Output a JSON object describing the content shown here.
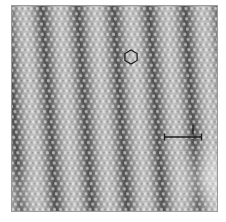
{
  "figure": {
    "type": "STM micrograph",
    "colormap": "grayscale",
    "colors": {
      "background": "#ffffff",
      "base_gray": "#a8a8a8",
      "dark_stripe": "#3a3a3a",
      "bright_atom": "#e6e6e6",
      "annotation": "#1a1a1a"
    },
    "panel": {
      "x": 11,
      "y": 5,
      "width": 207,
      "height": 207
    },
    "stripes": {
      "orientation": "near-vertical, tilted slightly clockwise",
      "period_px": 36,
      "dark_x_at_top": [
        30,
        67,
        102,
        138,
        175,
        207
      ],
      "dark_x_at_bottom": [
        42,
        72,
        108,
        145,
        183
      ]
    },
    "lattice": {
      "pattern": "hexagonal",
      "spacing_px": 6
    },
    "annotations": {
      "hexagon_marker": {
        "cx": 131,
        "cy": 57,
        "r": 7,
        "icon": "hexagon-icon"
      },
      "scale_bar": {
        "x1": 164,
        "x2": 202,
        "y": 137,
        "label": ""
      },
      "tick_marker": {
        "x": 193,
        "y1": 125,
        "y2": 134
      }
    },
    "caption": ""
  }
}
